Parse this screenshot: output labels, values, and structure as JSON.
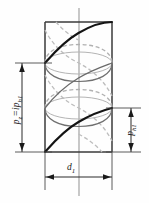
{
  "figure": {
    "background_color": "#fefefe",
    "ink_color": "#1a1a1a",
    "hidden_line_color": "#a8a8a8",
    "cylinder": {
      "left_x": 45,
      "right_x": 112,
      "top_y": 22,
      "bottom_y": 152,
      "diameter_px": 67,
      "height_px": 130,
      "ellipse_ry": 11
    },
    "axis": {
      "x": 79,
      "top_y": 8,
      "bottom_y": 196,
      "style": "center-line"
    }
  },
  "labels": {
    "lead": {
      "name": "lead-label",
      "symbol": "p",
      "symbol_sub": "z",
      "equals": "=",
      "factor": "i",
      "term": "p",
      "term_sub": "h1",
      "full_text": "pz = iph1",
      "rotation_deg": -90,
      "meaning": "lead"
    },
    "pitch": {
      "name": "pitch-label",
      "symbol": "p",
      "symbol_sub": "h1",
      "full_text": "ph1",
      "rotation_deg": -90,
      "meaning": "pitch"
    },
    "diameter": {
      "name": "diameter-label",
      "symbol": "d",
      "symbol_sub": "1",
      "full_text": "d1",
      "rotation_deg": 0,
      "meaning": "pitch diameter"
    }
  },
  "dimensions": {
    "lead": {
      "orientation": "vertical",
      "line_x": 22,
      "start_y": 63,
      "end_y": 152,
      "extension_from_x": 22,
      "extension_to_x": 52,
      "arrowheads": "both"
    },
    "pitch": {
      "orientation": "vertical",
      "line_x": 131,
      "start_y": 108,
      "end_y": 152,
      "extension_from_x": 106,
      "extension_to_x": 140,
      "arrowheads": "both"
    },
    "diameter": {
      "orientation": "horizontal",
      "line_y": 177,
      "start_x": 45,
      "end_x": 112,
      "extension_to_y": 190,
      "arrowheads": "both"
    }
  },
  "helix": {
    "starts": 2,
    "turns_visible": 2,
    "solid_label": "front (visible) helix",
    "dashed_label": "rear (hidden) helix"
  }
}
